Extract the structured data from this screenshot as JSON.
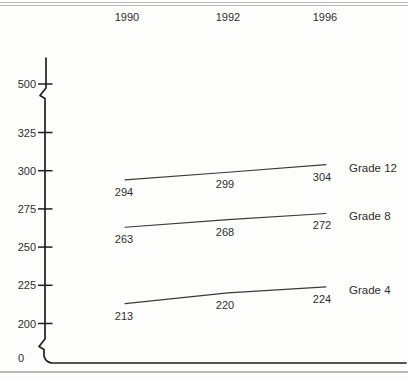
{
  "figure": {
    "background_color": "#fdfdfc",
    "ink_color": "#2e2e2e",
    "axis_color": "#1f1f1f",
    "rule_color": "#b8b8b8"
  },
  "chart_data": {
    "type": "line",
    "title": "",
    "x_labels": [
      "1990",
      "1992",
      "1996"
    ],
    "series": [
      {
        "name": "Grade 12",
        "values": [
          294,
          299,
          304
        ]
      },
      {
        "name": "Grade 8",
        "values": [
          263,
          268,
          272
        ]
      },
      {
        "name": "Grade 4",
        "values": [
          213,
          220,
          224
        ]
      }
    ],
    "y_ticks": [
      500,
      325,
      300,
      275,
      250,
      225,
      200
    ],
    "y_baseline_label": "0",
    "ylim": [
      0,
      500
    ],
    "y_axis_breaks": [
      "between 0 and 200",
      "between 325 and 500"
    ],
    "grid": "off",
    "legend_position": "right-of-line-ends",
    "value_labels_shown": true
  }
}
